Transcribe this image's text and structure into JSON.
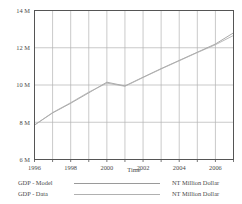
{
  "chart_data": {
    "type": "line",
    "title": "",
    "xlabel": "Time",
    "ylabel": "",
    "xlim": [
      1996,
      2007
    ],
    "ylim": [
      6,
      14
    ],
    "grid": true,
    "unit": "NT Million Dollar",
    "x_ticks": [
      "1996",
      "1998",
      "2000",
      "2002",
      "2004",
      "2006"
    ],
    "x_tick_values": [
      1996,
      1998,
      2000,
      2002,
      2004,
      2006
    ],
    "y_ticks": [
      "6 M",
      "8 M",
      "10 M",
      "12 M",
      "14 M"
    ],
    "y_tick_values": [
      6,
      8,
      10,
      12,
      14
    ],
    "x": [
      1996,
      1997,
      1998,
      1999,
      2000,
      2001,
      2002,
      2003,
      2004,
      2005,
      2006,
      2007
    ],
    "legend_position": "below-plot",
    "series": [
      {
        "name": "GDP - Model",
        "unit": "NT Million Dollar",
        "color": "#9a9a9a",
        "values": [
          7.85,
          8.5,
          9.02,
          9.58,
          10.15,
          9.95,
          10.42,
          10.88,
          11.32,
          11.76,
          12.2,
          12.8
        ]
      },
      {
        "name": "GDP - Data",
        "unit": "NT Million Dollar",
        "color": "#b0b0b0",
        "values": [
          7.85,
          8.52,
          9.05,
          9.62,
          10.1,
          9.93,
          10.4,
          10.86,
          11.3,
          11.74,
          12.16,
          12.66
        ]
      }
    ]
  },
  "axes": {
    "x_axis_title": "Time",
    "y_tick_labels": [
      "14 M",
      "12 M",
      "10 M",
      "8 M",
      "6 M"
    ],
    "x_tick_labels": [
      "1996",
      "1998",
      "2000",
      "2002",
      "2004",
      "2006"
    ]
  },
  "legend": {
    "rows": [
      {
        "name": "GDP - Model",
        "unit": "NT Million Dollar",
        "color": "#9a9a9a"
      },
      {
        "name": "GDP - Data",
        "unit": "NT Million Dollar",
        "color": "#b0b0b0"
      }
    ]
  },
  "colors": {
    "axis": "#4a4a4a",
    "grid": "#b3b3b3",
    "frame": "#555555",
    "background": "#ffffff"
  }
}
